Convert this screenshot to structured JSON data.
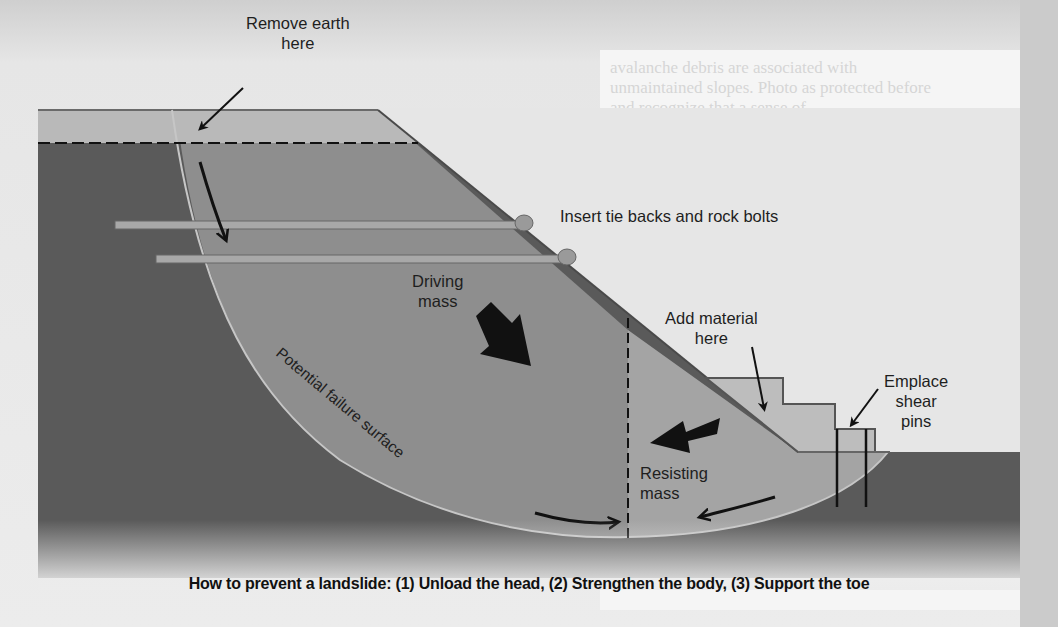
{
  "background": {
    "ghost_text_lines": [
      "avalanche debris are associated with",
      "unmaintained slopes. Photo as protected before",
      "and recognize that a sense of",
      "name\" can be fatal."
    ]
  },
  "diagram": {
    "labels": {
      "remove_earth": [
        "Remove earth",
        "here"
      ],
      "insert_tie_backs": "Insert tie backs and rock bolts",
      "driving_mass": [
        "Driving",
        "mass"
      ],
      "add_material": [
        "Add material",
        "here"
      ],
      "emplace_shear_pins": [
        "Emplace",
        "shear",
        "pins"
      ],
      "resisting_mass": [
        "Resisting",
        "mass"
      ],
      "potential_failure_surface": "Potential failure surface"
    },
    "caption": "How to prevent a landslide: (1) Unload the head, (2) Strengthen the body, (3) Support the toe",
    "colors": {
      "bedrock": "#5a5a5a",
      "slide_mass": "#8e8e8e",
      "resisting_mass": "#a4a4a4",
      "head_cap": "#b9b9b9",
      "added_material": "#bdbdbd",
      "sky": "#e8e8e8",
      "ink": "#111111"
    }
  }
}
